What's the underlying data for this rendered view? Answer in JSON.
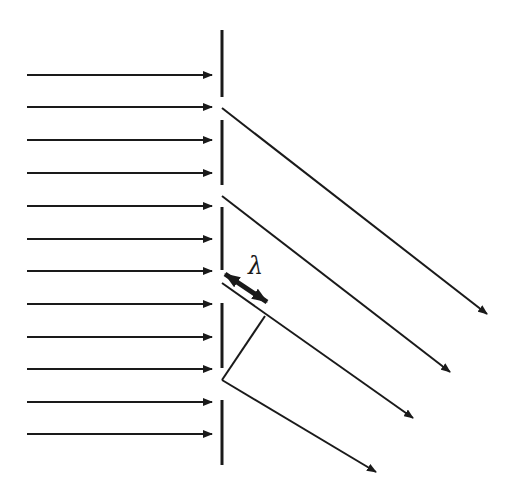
{
  "diagram": {
    "colors": {
      "stroke": "#1a1a1a",
      "background": "#ffffff"
    },
    "label_lambda": "λ",
    "incident_rays": {
      "x_start": 27,
      "x_end": 212,
      "y_positions": [
        75,
        107,
        140,
        173,
        206,
        239,
        271,
        304,
        337,
        369,
        402,
        434
      ]
    },
    "barrier": {
      "x": 222,
      "segments": [
        [
          30,
          97
        ],
        [
          120,
          185
        ],
        [
          207,
          270
        ],
        [
          303,
          368
        ],
        [
          400,
          465
        ]
      ]
    },
    "diffracted_rays": [
      {
        "x1": 222,
        "y1": 108,
        "x2": 487,
        "y2": 314
      },
      {
        "x1": 222,
        "y1": 196,
        "x2": 450,
        "y2": 372
      },
      {
        "x1": 222,
        "y1": 283,
        "x2": 413,
        "y2": 418
      },
      {
        "x1": 222,
        "y1": 380,
        "x2": 376,
        "y2": 472
      }
    ],
    "wavefront_line": {
      "x1": 222,
      "y1": 380,
      "x2": 265,
      "y2": 316
    },
    "lambda_arrow": {
      "x1": 225,
      "y1": 274,
      "x2": 267,
      "y2": 302
    }
  }
}
